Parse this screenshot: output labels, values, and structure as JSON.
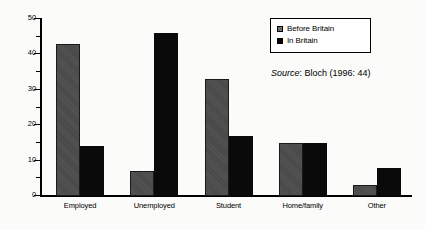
{
  "chart_data": {
    "type": "bar",
    "title": "",
    "subtitle": "",
    "xlabel": "",
    "ylabel": "",
    "ylim": [
      0,
      50
    ],
    "y_ticks_major": [
      0,
      10,
      20,
      30,
      40,
      50
    ],
    "y_ticks_minor": [
      5,
      15,
      25,
      35,
      45
    ],
    "y_tick_labels": [
      "0",
      "10",
      "20",
      "30",
      "40",
      "50"
    ],
    "grid": false,
    "legend_position": "top-right",
    "categories": [
      "Employed",
      "Unemployed",
      "Student",
      "Home/family",
      "Other"
    ],
    "series": [
      {
        "name": "Before Britain",
        "color": "#4b4b4b",
        "values": [
          43,
          7,
          33,
          15,
          3
        ]
      },
      {
        "name": "In Britain",
        "color": "#0a0a0a",
        "values": [
          14,
          46,
          17,
          15,
          8
        ]
      }
    ],
    "annotations": [
      {
        "name": "source-note",
        "italic_prefix": "Source",
        "rest": ": Bloch (1996: 44)"
      }
    ]
  },
  "legend": {
    "entries": [
      {
        "label": "Before Britain",
        "swatch": "hatched-gray-swatch-icon"
      },
      {
        "label": "In Britain",
        "swatch": "solid-black-swatch-icon"
      }
    ]
  },
  "source": {
    "italic_prefix": "Source",
    "rest": ": Bloch (1996: 44)"
  }
}
